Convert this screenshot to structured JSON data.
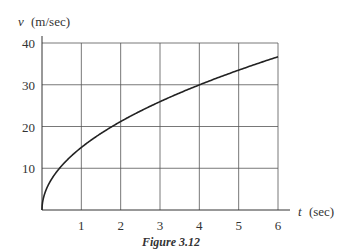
{
  "chart_data": {
    "type": "line",
    "title": "",
    "caption": "Figure 3.12",
    "xlabel_var": "t",
    "xlabel_unit": "(sec)",
    "ylabel_var": "v",
    "ylabel_unit": "(m/sec)",
    "xlim": [
      0,
      6
    ],
    "ylim": [
      0,
      40
    ],
    "xticks": [
      1,
      2,
      3,
      4,
      5,
      6
    ],
    "yticks": [
      10,
      20,
      30,
      40
    ],
    "grid": true,
    "series": [
      {
        "name": "v(t)",
        "x": [
          0,
          0.1,
          0.25,
          0.5,
          1,
          1.5,
          2,
          2.5,
          3,
          3.5,
          4,
          4.5,
          5,
          5.5,
          6
        ],
        "values": [
          0,
          4.7,
          7.5,
          10.6,
          15,
          18.4,
          21.2,
          23.7,
          26,
          28.1,
          30,
          31.8,
          33.5,
          35.2,
          36.7
        ]
      }
    ]
  }
}
